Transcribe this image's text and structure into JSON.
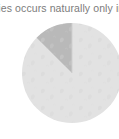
{
  "caption": {
    "text": "cies occurs naturally only in G"
  },
  "colors": {
    "background": "#ffffff",
    "caption_text": "#7b7b7b",
    "pie_major_fill": "#e2e2e2",
    "pie_highlight_fill": "#b9b9b9",
    "pie_divider_line": "#cfcfcf",
    "texture": "#d4d4d4"
  },
  "chart_data": {
    "type": "pie",
    "title": "",
    "subtitle": "",
    "xlabel": "",
    "ylabel": "",
    "legend": [],
    "legend_position": "none",
    "grid": false,
    "start_angle_deg": 0,
    "direction": "clockwise",
    "categories": [
      "Remainder",
      "Highlighted segment"
    ],
    "values": [
      87.5,
      12.5
    ],
    "labels": [
      "",
      ""
    ],
    "slices": [
      {
        "name": "Remainder",
        "value": 87.5,
        "color": "#e2e2e2",
        "start_angle_deg": 0,
        "end_angle_deg": 315,
        "exploded": false
      },
      {
        "name": "Highlighted segment",
        "value": 12.5,
        "color": "#b9b9b9",
        "start_angle_deg": 315,
        "end_angle_deg": 360,
        "exploded": false
      }
    ],
    "annotations": []
  },
  "geometry": {
    "center_x": 72,
    "center_y": 55,
    "radius": 50
  }
}
